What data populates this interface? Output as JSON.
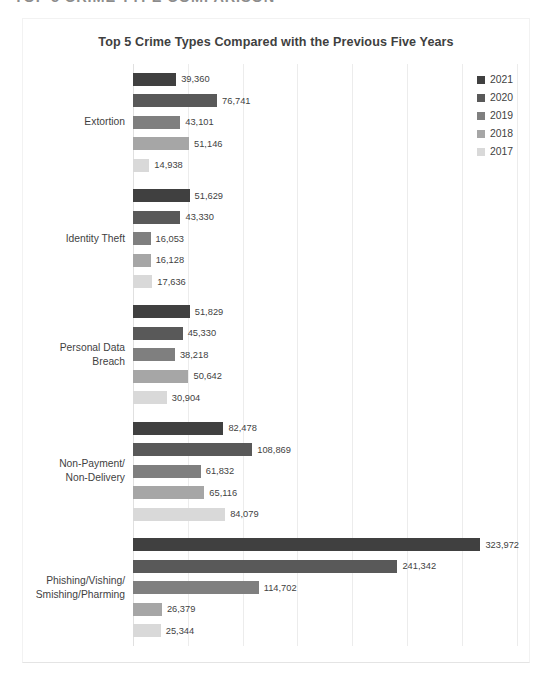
{
  "document": {
    "heading": "TOP 5 CRIME TYPE COMPARISON"
  },
  "chart_data": {
    "type": "bar",
    "orientation": "horizontal",
    "title": "Top 5 Crime Types Compared with the Previous Five Years",
    "xlabel": "",
    "ylabel": "",
    "grid": true,
    "legend_position": "right",
    "xlim": [
      0,
      350000
    ],
    "x_gridline_step": 50000,
    "categories": [
      "Extortion",
      "Identity Theft",
      "Personal Data\nBreach",
      "Non-Payment/\nNon-Delivery",
      "Phishing/Vishing/\nSmishing/Pharming"
    ],
    "series": [
      {
        "name": "2021",
        "color": "#404040",
        "values": [
          39360,
          51629,
          51829,
          82478,
          323972
        ],
        "labels": [
          "39,360",
          "51,629",
          "51,829",
          "82,478",
          "323,972"
        ]
      },
      {
        "name": "2020",
        "color": "#595959",
        "values": [
          76741,
          43330,
          45330,
          108869,
          241342
        ],
        "labels": [
          "76,741",
          "43,330",
          "45,330",
          "108,869",
          "241,342"
        ]
      },
      {
        "name": "2019",
        "color": "#7f7f7f",
        "values": [
          43101,
          16053,
          38218,
          61832,
          114702
        ],
        "labels": [
          "43,101",
          "16,053",
          "38,218",
          "61,832",
          "114,702"
        ]
      },
      {
        "name": "2018",
        "color": "#a6a6a6",
        "values": [
          51146,
          16128,
          50642,
          65116,
          26379
        ],
        "labels": [
          "51,146",
          "16,128",
          "50,642",
          "65,116",
          "26,379"
        ]
      },
      {
        "name": "2017",
        "color": "#d9d9d9",
        "values": [
          14938,
          17636,
          30904,
          84079,
          25344
        ],
        "labels": [
          "14,938",
          "17,636",
          "30,904",
          "84,079",
          "25,344"
        ]
      }
    ]
  },
  "legend": {
    "items": [
      {
        "label": "2021",
        "color": "#404040"
      },
      {
        "label": "2020",
        "color": "#595959"
      },
      {
        "label": "2019",
        "color": "#7f7f7f"
      },
      {
        "label": "2018",
        "color": "#a6a6a6"
      },
      {
        "label": "2017",
        "color": "#d9d9d9"
      }
    ]
  }
}
